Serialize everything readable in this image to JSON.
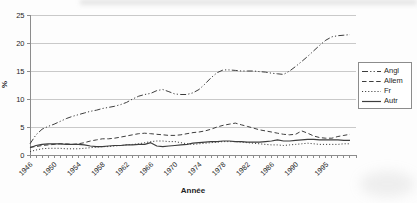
{
  "chart_data": {
    "type": "line",
    "title": "",
    "xlabel": "Année",
    "ylabel": "%",
    "xlim": [
      1946,
      2000
    ],
    "ylim": [
      0,
      25
    ],
    "yticks": [
      0,
      5,
      10,
      15,
      20,
      25
    ],
    "xticks": [
      1946,
      1950,
      1954,
      1958,
      1962,
      1966,
      1970,
      1974,
      1978,
      1982,
      1986,
      1990,
      1995
    ],
    "grid": true,
    "legend_position": "right",
    "x": [
      1946,
      1947,
      1948,
      1949,
      1950,
      1951,
      1952,
      1953,
      1954,
      1955,
      1956,
      1957,
      1958,
      1959,
      1960,
      1961,
      1962,
      1963,
      1964,
      1965,
      1966,
      1967,
      1968,
      1969,
      1970,
      1971,
      1972,
      1973,
      1974,
      1975,
      1976,
      1977,
      1978,
      1979,
      1980,
      1981,
      1982,
      1983,
      1984,
      1985,
      1986,
      1987,
      1988,
      1989,
      1990,
      1991,
      1992,
      1993,
      1994,
      1995,
      1996,
      1997,
      1998,
      1999
    ],
    "series": [
      {
        "name": "Angl",
        "dash": "dash-dot-dot",
        "values": [
          2.0,
          3.6,
          4.6,
          5.1,
          5.5,
          6.0,
          6.5,
          6.9,
          7.2,
          7.5,
          7.8,
          8.0,
          8.3,
          8.5,
          8.7,
          9.0,
          9.4,
          10.0,
          10.5,
          10.8,
          11.0,
          11.5,
          11.7,
          11.3,
          10.9,
          10.8,
          10.8,
          11.1,
          11.7,
          12.7,
          13.8,
          14.7,
          15.2,
          15.2,
          15.1,
          15.0,
          15.0,
          15.0,
          14.9,
          14.8,
          14.6,
          14.5,
          14.4,
          15.0,
          15.8,
          16.7,
          17.6,
          18.6,
          19.6,
          20.5,
          21.1,
          21.3,
          21.4,
          21.5
        ]
      },
      {
        "name": "Allem",
        "dash": "dashed",
        "values": [
          1.4,
          1.5,
          1.7,
          1.8,
          1.9,
          2.0,
          2.0,
          1.9,
          2.0,
          2.2,
          2.5,
          2.7,
          2.9,
          2.9,
          3.0,
          3.2,
          3.4,
          3.6,
          3.8,
          3.9,
          3.8,
          3.7,
          3.6,
          3.5,
          3.5,
          3.6,
          3.8,
          4.0,
          4.1,
          4.3,
          4.6,
          5.0,
          5.3,
          5.5,
          5.7,
          5.4,
          5.1,
          4.8,
          4.5,
          4.3,
          4.1,
          3.9,
          3.7,
          3.6,
          3.7,
          4.3,
          3.9,
          3.4,
          3.1,
          3.0,
          3.0,
          3.3,
          3.5,
          3.7
        ]
      },
      {
        "name": "Fr",
        "dash": "dotted",
        "values": [
          0.6,
          0.9,
          1.1,
          1.2,
          1.2,
          1.2,
          1.1,
          1.1,
          1.1,
          1.2,
          1.3,
          1.4,
          1.5,
          1.5,
          1.6,
          1.7,
          1.8,
          1.9,
          2.0,
          2.2,
          2.4,
          2.5,
          2.5,
          2.4,
          2.4,
          2.2,
          2.0,
          1.9,
          2.0,
          2.1,
          2.2,
          2.3,
          2.4,
          2.4,
          2.4,
          2.3,
          2.2,
          2.1,
          2.0,
          1.9,
          1.8,
          1.8,
          1.7,
          1.8,
          1.9,
          2.0,
          2.1,
          2.0,
          1.9,
          1.9,
          1.9,
          1.9,
          2.0,
          2.0
        ]
      },
      {
        "name": "Autr",
        "dash": "solid",
        "values": [
          1.3,
          1.7,
          1.9,
          2.0,
          2.0,
          2.0,
          1.9,
          1.9,
          1.9,
          1.8,
          1.6,
          1.5,
          1.5,
          1.6,
          1.7,
          1.7,
          1.8,
          1.8,
          1.9,
          1.9,
          2.2,
          1.6,
          1.5,
          1.6,
          1.7,
          1.8,
          1.9,
          2.1,
          2.2,
          2.3,
          2.4,
          2.4,
          2.5,
          2.5,
          2.4,
          2.4,
          2.3,
          2.3,
          2.3,
          2.4,
          2.5,
          2.7,
          2.5,
          2.5,
          2.6,
          2.7,
          2.8,
          2.8,
          2.7,
          2.7,
          2.7,
          2.7,
          2.6,
          2.6
        ]
      }
    ],
    "colors": {
      "line": "#3d3d3d",
      "grid": "#c9c9c9",
      "axis": "#8c8c8c",
      "text": "#262626",
      "legend_border": "#8c8c8c",
      "background": "#ffffff"
    }
  }
}
